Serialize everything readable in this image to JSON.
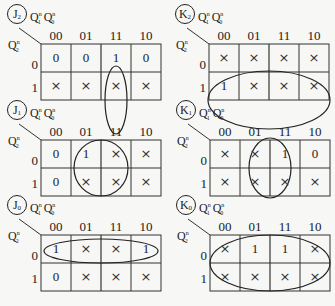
{
  "col_headers": [
    "00",
    "01",
    "11",
    "10"
  ],
  "row_headers": [
    "0",
    "1"
  ],
  "col_var": {
    "base": "Q",
    "subs": [
      "1",
      "0"
    ],
    "sup": "n"
  },
  "row_var": {
    "base": "Q",
    "sub": "2",
    "sup": "n"
  },
  "dont_care_symbol": "×",
  "maps": [
    {
      "id": "J2",
      "letter": "J",
      "sub": "2",
      "cells": [
        [
          "0",
          "0",
          "1",
          "0"
        ],
        [
          "×",
          "×",
          "×",
          "×"
        ]
      ],
      "grouping": "column 11, both rows (vertical ellipse)"
    },
    {
      "id": "K2",
      "letter": "K",
      "sub": "2",
      "cells": [
        [
          "×",
          "×",
          "×",
          "×"
        ],
        [
          "1",
          "×",
          "×",
          "×"
        ]
      ],
      "grouping": "all eight cells (large ellipse)"
    },
    {
      "id": "J1",
      "letter": "J",
      "sub": "1",
      "cells": [
        [
          "0",
          "1",
          "×",
          "×"
        ],
        [
          "0",
          "×",
          "×",
          "×"
        ]
      ],
      "grouping": "columns 01 and 11, both rows (circle)"
    },
    {
      "id": "K1",
      "letter": "K",
      "sub": "1",
      "cells": [
        [
          "×",
          "×",
          "1",
          "0"
        ],
        [
          "×",
          "×",
          "×",
          "×"
        ]
      ],
      "grouping": "columns 01 and 11, both rows (ellipse)"
    },
    {
      "id": "J0",
      "letter": "J",
      "sub": "0",
      "cells": [
        [
          "1",
          "×",
          "×",
          "1"
        ],
        [
          "0",
          "×",
          "×",
          "×"
        ]
      ],
      "grouping": "row 0, all columns (horizontal ellipse)"
    },
    {
      "id": "K0",
      "letter": "K",
      "sub": "0",
      "cells": [
        [
          "×",
          "1",
          "1",
          "×"
        ],
        [
          "×",
          "×",
          "×",
          "×"
        ]
      ],
      "grouping": "all eight cells (large ellipse)"
    }
  ]
}
